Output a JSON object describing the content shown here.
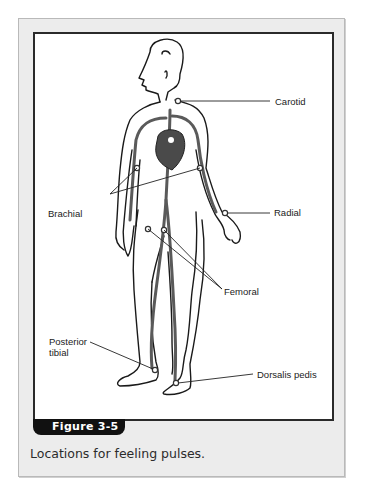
{
  "figure": {
    "tab_label": "Figure 3-5",
    "caption": "Locations for feeling pulses.",
    "colors": {
      "frame_background": "#ececec",
      "panel_border": "#2a2a2a",
      "tab_background": "#111111",
      "artery_gray": "#555555"
    },
    "labels": {
      "carotid": "Carotid",
      "radial": "Radial",
      "brachial": "Brachial",
      "femoral": "Femoral",
      "posterior_tibial_line1": "Posterior",
      "posterior_tibial_line2": "tibial",
      "dorsalis_pedis": "Dorsalis pedis"
    }
  }
}
